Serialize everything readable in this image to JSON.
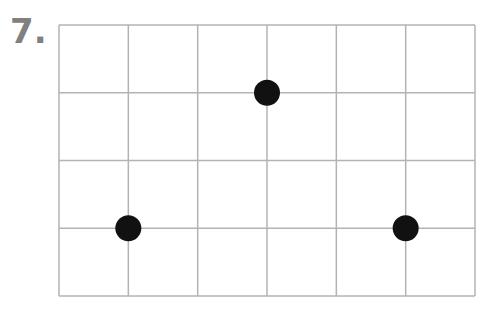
{
  "problem": {
    "number_label": "7."
  },
  "grid": {
    "columns": 6,
    "rows": 4,
    "line_color": "#b3b3b3",
    "left": 59,
    "top": 25,
    "right": 475,
    "bottom": 296
  },
  "points": [
    {
      "col": 1,
      "row": 3,
      "label": "point-1"
    },
    {
      "col": 3,
      "row": 1,
      "label": "point-2"
    },
    {
      "col": 5,
      "row": 3,
      "label": "point-3"
    }
  ],
  "point_color": "#111111"
}
